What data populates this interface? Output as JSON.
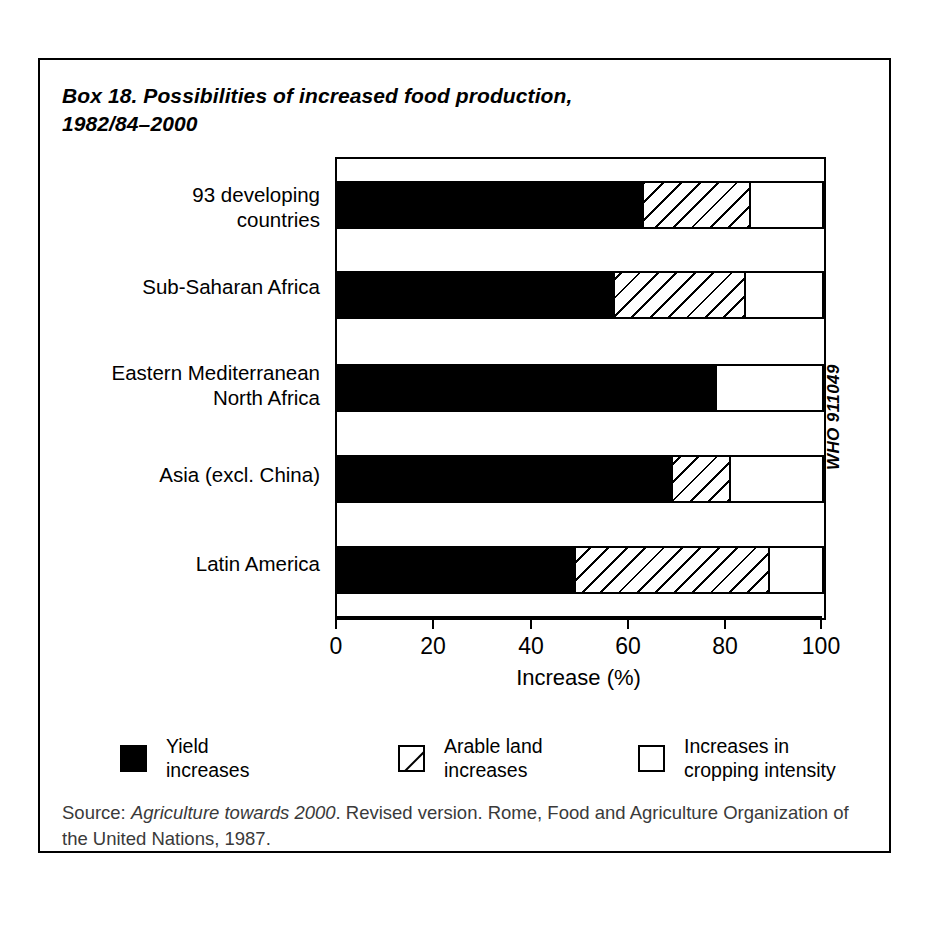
{
  "box": {
    "title_line1": "Box 18. Possibilities of increased food production,",
    "title_line2": "1982/84–2000",
    "who_code": "WHO 911049",
    "source_prefix": "Source: ",
    "source_italic": "Agriculture towards 2000",
    "source_rest": ". Revised version. Rome, Food and Agriculture Organization of the United Nations, 1987."
  },
  "legend": {
    "items": [
      {
        "key": "yield",
        "label": "Yield\nincreases",
        "swatch": "solid-black-square"
      },
      {
        "key": "arable",
        "label": "Arable land\nincreases",
        "swatch": "hatched-square"
      },
      {
        "key": "crop",
        "label": "Increases in\ncropping intensity",
        "swatch": "empty-square"
      }
    ]
  },
  "chart_data": {
    "type": "bar",
    "orientation": "horizontal",
    "stacked": true,
    "title": "Box 18. Possibilities of increased food production, 1982/84–2000",
    "xlabel": "Increase (%)",
    "ylabel": "",
    "xlim": [
      0,
      100
    ],
    "xticks": [
      0,
      20,
      40,
      60,
      80,
      100
    ],
    "xticklabels": [
      "0",
      "20",
      "40",
      "60",
      "80",
      "100"
    ],
    "grid": false,
    "legend_position": "bottom",
    "categories": [
      "93 developing\ncountries",
      "Sub-Saharan Africa",
      "Eastern Mediterranean\nNorth Africa",
      "Asia (excl. China)",
      "Latin America"
    ],
    "series": [
      {
        "name": "Yield increases",
        "values": [
          63,
          57,
          78,
          69,
          49
        ]
      },
      {
        "name": "Arable land increases",
        "values": [
          22,
          27,
          0,
          12,
          40
        ]
      },
      {
        "name": "Increases in cropping intensity",
        "values": [
          15,
          16,
          22,
          19,
          11
        ]
      }
    ],
    "cumulative_boundaries": [
      [
        63,
        85,
        100
      ],
      [
        57,
        84,
        100
      ],
      [
        78,
        78,
        100
      ],
      [
        69,
        81,
        100
      ],
      [
        49,
        89,
        100
      ]
    ]
  },
  "axis": {
    "tick_0": "0",
    "tick_20": "20",
    "tick_40": "40",
    "tick_60": "60",
    "tick_80": "80",
    "tick_100": "100",
    "title": "Increase (%)"
  },
  "categories_flat": {
    "c0": "93 developing\ncountries",
    "c1": "Sub-Saharan Africa",
    "c2": "Eastern Mediterranean\nNorth Africa",
    "c3": "Asia (excl. China)",
    "c4": "Latin America"
  }
}
